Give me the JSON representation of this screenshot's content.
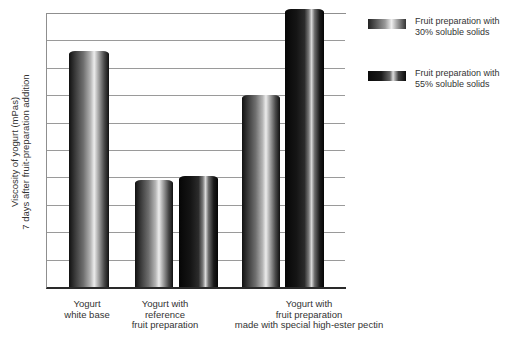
{
  "chart_data": {
    "type": "bar",
    "title": "",
    "xlabel": "",
    "ylabel": "Viscosity of yogurt (mPas) 7 days after fruit-preparation addition",
    "ylabel_line1": "Viscosity of yogurt (mPas)",
    "ylabel_line2": "7 days after fruit-preparation addition",
    "y_axis": {
      "numeric_tick_labels_shown": false,
      "gridline_count": 10,
      "ylim_gridline_units": [
        0,
        10
      ]
    },
    "categories": [
      "Yogurt white base",
      "Yogurt with reference fruit preparation",
      "Yogurt with fruit preparation made with special high-ester pectin"
    ],
    "category_label_lines": [
      [
        "Yogurt",
        "white base"
      ],
      [
        "Yogurt with",
        "reference",
        "fruit preparation"
      ],
      [
        "Yogurt with",
        "fruit preparation",
        "made with special high-ester pectin"
      ]
    ],
    "legend": {
      "position": "outside top-right",
      "items": [
        {
          "line1": "Fruit preparation with",
          "line2": "30% soluble solids",
          "shade": "light"
        },
        {
          "line1": "Fruit preparation with",
          "line2": "55% soluble solids",
          "shade": "dark"
        }
      ]
    },
    "bars": [
      {
        "category": "Yogurt white base",
        "series": null,
        "shade": "light",
        "value": 8.6
      },
      {
        "category": "Yogurt with reference fruit preparation",
        "series": "Fruit preparation with 30% soluble solids",
        "shade": "light",
        "value": 3.9
      },
      {
        "category": "Yogurt with reference fruit preparation",
        "series": "Fruit preparation with 55% soluble solids",
        "shade": "dark",
        "value": 4.05
      },
      {
        "category": "Yogurt with fruit preparation made with special high-ester pectin",
        "series": "Fruit preparation with 30% soluble solids",
        "shade": "light",
        "value": 7.0
      },
      {
        "category": "Yogurt with fruit preparation made with special high-ester pectin",
        "series": "Fruit preparation with 55% soluble solids",
        "shade": "dark",
        "value": 10.15
      }
    ],
    "value_unit_note": "gridline intervals; y axis has no numeric labels"
  },
  "colors": {
    "background": "#ffffff",
    "gridline": "#9a9a9a",
    "axis_bottom": "#2a2a2a",
    "text": "#333333",
    "bar_highlight": "#ececec",
    "bar_shadow": "#0a0a0a"
  }
}
